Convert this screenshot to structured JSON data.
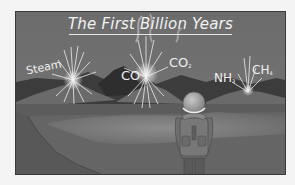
{
  "illustration": {
    "title": "The First Billion Years",
    "gases": [
      {
        "id": "steam",
        "label": "Steam",
        "sub": ""
      },
      {
        "id": "co",
        "label": "CO",
        "sub": ""
      },
      {
        "id": "co2",
        "label": "CO",
        "sub": "2"
      },
      {
        "id": "nh3",
        "label": "NH",
        "sub": "3"
      },
      {
        "id": "ch4",
        "label": "CH",
        "sub": "4"
      }
    ],
    "colors": {
      "sky": "#707070",
      "mountains_dark": "#3a3a3a",
      "hills": "#5e5e5e",
      "ground": "#686868",
      "text": "#f0f0f0"
    },
    "figure": "hiker-with-backpack"
  }
}
